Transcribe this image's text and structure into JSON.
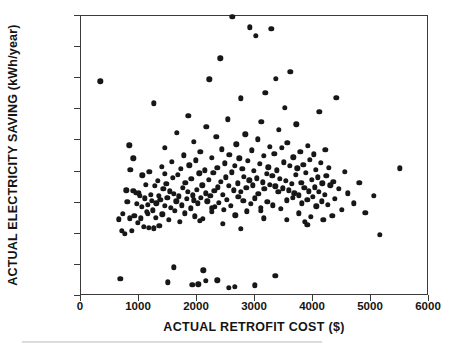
{
  "figure": {
    "kind": "scatter-plot",
    "background_color": "#ffffff",
    "marker_color": "#171717",
    "axis_color": "#3a3a3a"
  },
  "axis_titles": {
    "y": "ACTUAL ELECTRICITY SAVING (kWh/year)",
    "x": "ACTUAL RETROFIT COST ($)"
  },
  "chart_data": {
    "type": "scatter",
    "title": "",
    "xlabel": "ACTUAL RETROFIT COST ($)",
    "ylabel": "ACTUAL ELECTRICITY SAVING (kWh/year)",
    "xlim": [
      0,
      6000
    ],
    "ylim": [
      -5000,
      17500
    ],
    "xticks": [
      0,
      1000,
      2000,
      3000,
      4000,
      5000,
      6000
    ],
    "xtick_labels": [
      "0",
      "1000",
      "2000",
      "3000",
      "4000",
      "5000",
      "6000"
    ],
    "yticks": [
      -5000,
      -2500,
      0,
      2500,
      5000,
      7500,
      10000,
      12500,
      15000,
      17500
    ],
    "ytick_labels": [
      "-5000",
      "-2500",
      "0",
      "2500",
      "5000",
      "7500",
      "10000",
      "12500",
      "15000",
      "17500"
    ],
    "grid": false,
    "legend": false,
    "marker": "filled-circle",
    "marker_color": "#171717",
    "n_points": 248,
    "points": [
      [
        330,
        12250
      ],
      [
        650,
        1150
      ],
      [
        680,
        -3600
      ],
      [
        700,
        250
      ],
      [
        720,
        1600
      ],
      [
        760,
        0
      ],
      [
        780,
        3500
      ],
      [
        800,
        2550
      ],
      [
        830,
        7100
      ],
      [
        840,
        1250
      ],
      [
        850,
        5150
      ],
      [
        880,
        250
      ],
      [
        900,
        3450
      ],
      [
        920,
        1450
      ],
      [
        940,
        3300
      ],
      [
        960,
        2400
      ],
      [
        980,
        900
      ],
      [
        1000,
        3250
      ],
      [
        1010,
        3050
      ],
      [
        1030,
        1250
      ],
      [
        1050,
        2150
      ],
      [
        1060,
        4700
      ],
      [
        1080,
        550
      ],
      [
        1100,
        2850
      ],
      [
        1120,
        3950
      ],
      [
        1130,
        1750
      ],
      [
        1150,
        2350
      ],
      [
        1170,
        500
      ],
      [
        1180,
        5000
      ],
      [
        1200,
        3150
      ],
      [
        1220,
        2650
      ],
      [
        1240,
        1900
      ],
      [
        1250,
        10500
      ],
      [
        1270,
        3850
      ],
      [
        1290,
        1300
      ],
      [
        1300,
        2450
      ],
      [
        1320,
        4250
      ],
      [
        1340,
        3050
      ],
      [
        1350,
        650
      ],
      [
        1370,
        2750
      ],
      [
        1390,
        5400
      ],
      [
        1400,
        1550
      ],
      [
        1420,
        3600
      ],
      [
        1440,
        2250
      ],
      [
        1450,
        6900
      ],
      [
        1470,
        4000
      ],
      [
        1490,
        2900
      ],
      [
        1500,
        -3900
      ],
      [
        1510,
        1100
      ],
      [
        1530,
        3400
      ],
      [
        1550,
        2100
      ],
      [
        1570,
        5800
      ],
      [
        1580,
        4500
      ],
      [
        1600,
        3200
      ],
      [
        1620,
        1850
      ],
      [
        1640,
        2600
      ],
      [
        1650,
        8100
      ],
      [
        1670,
        4750
      ],
      [
        1690,
        3000
      ],
      [
        1700,
        950
      ],
      [
        1720,
        5200
      ],
      [
        1740,
        2300
      ],
      [
        1750,
        3700
      ],
      [
        1770,
        6300
      ],
      [
        1790,
        1650
      ],
      [
        1800,
        4100
      ],
      [
        1820,
        2800
      ],
      [
        1840,
        3350
      ],
      [
        1850,
        9500
      ],
      [
        1870,
        5500
      ],
      [
        1890,
        2050
      ],
      [
        1900,
        4400
      ],
      [
        1920,
        -4100
      ],
      [
        1930,
        3100
      ],
      [
        1950,
        7400
      ],
      [
        1960,
        1400
      ],
      [
        1980,
        5900
      ],
      [
        2000,
        3550
      ],
      [
        2010,
        2450
      ],
      [
        2020,
        -4050
      ],
      [
        2040,
        4850
      ],
      [
        2060,
        6600
      ],
      [
        2070,
        2900
      ],
      [
        2090,
        3900
      ],
      [
        2100,
        1200
      ],
      [
        2110,
        -2950
      ],
      [
        2130,
        5100
      ],
      [
        2150,
        3250
      ],
      [
        2160,
        8600
      ],
      [
        2180,
        2600
      ],
      [
        2200,
        4350
      ],
      [
        2210,
        12400
      ],
      [
        2230,
        3050
      ],
      [
        2250,
        6100
      ],
      [
        2260,
        1750
      ],
      [
        2280,
        4900
      ],
      [
        2300,
        3450
      ],
      [
        2310,
        2150
      ],
      [
        2330,
        7800
      ],
      [
        2350,
        5300
      ],
      [
        2360,
        3750
      ],
      [
        2380,
        2500
      ],
      [
        2400,
        14100
      ],
      [
        2410,
        4200
      ],
      [
        2430,
        6800
      ],
      [
        2450,
        3150
      ],
      [
        2460,
        1950
      ],
      [
        2480,
        5650
      ],
      [
        2500,
        4550
      ],
      [
        2510,
        2750
      ],
      [
        2530,
        9200
      ],
      [
        2550,
        3850
      ],
      [
        2560,
        6350
      ],
      [
        2580,
        2250
      ],
      [
        2600,
        4950
      ],
      [
        2610,
        17450
      ],
      [
        2630,
        3500
      ],
      [
        2650,
        5450
      ],
      [
        2660,
        1500
      ],
      [
        2680,
        7200
      ],
      [
        2700,
        4050
      ],
      [
        2710,
        2950
      ],
      [
        2730,
        6050
      ],
      [
        2750,
        3350
      ],
      [
        2760,
        10900
      ],
      [
        2780,
        5200
      ],
      [
        2800,
        2650
      ],
      [
        2810,
        4600
      ],
      [
        2830,
        8000
      ],
      [
        2850,
        3700
      ],
      [
        2860,
        1800
      ],
      [
        2880,
        5850
      ],
      [
        2900,
        4300
      ],
      [
        2910,
        16600
      ],
      [
        2930,
        2400
      ],
      [
        2950,
        6700
      ],
      [
        2960,
        3900
      ],
      [
        2980,
        5050
      ],
      [
        3000,
        2850
      ],
      [
        3010,
        15900
      ],
      [
        3030,
        4450
      ],
      [
        3050,
        7600
      ],
      [
        3060,
        3200
      ],
      [
        3080,
        5600
      ],
      [
        3100,
        2100
      ],
      [
        3110,
        9000
      ],
      [
        3130,
        4150
      ],
      [
        3150,
        6250
      ],
      [
        3160,
        3600
      ],
      [
        3180,
        11350
      ],
      [
        3200,
        4800
      ],
      [
        3210,
        2550
      ],
      [
        3230,
        5350
      ],
      [
        3250,
        7000
      ],
      [
        3260,
        3950
      ],
      [
        3280,
        16450
      ],
      [
        3300,
        4650
      ],
      [
        3310,
        2300
      ],
      [
        3330,
        6450
      ],
      [
        3350,
        3800
      ],
      [
        3360,
        12450
      ],
      [
        3380,
        5100
      ],
      [
        3400,
        3350
      ],
      [
        3410,
        8350
      ],
      [
        3430,
        4400
      ],
      [
        3450,
        2000
      ],
      [
        3460,
        6900
      ],
      [
        3480,
        3650
      ],
      [
        3500,
        5750
      ],
      [
        3510,
        10100
      ],
      [
        3530,
        4250
      ],
      [
        3550,
        2700
      ],
      [
        3560,
        7300
      ],
      [
        3580,
        3500
      ],
      [
        3600,
        5450
      ],
      [
        3610,
        13000
      ],
      [
        3630,
        4000
      ],
      [
        3650,
        2900
      ],
      [
        3660,
        6150
      ],
      [
        3680,
        3250
      ],
      [
        3700,
        4750
      ],
      [
        3710,
        8800
      ],
      [
        3730,
        5250
      ],
      [
        3750,
        3100
      ],
      [
        3760,
        1650
      ],
      [
        3780,
        6600
      ],
      [
        3800,
        4100
      ],
      [
        3810,
        2450
      ],
      [
        3830,
        5550
      ],
      [
        3850,
        3700
      ],
      [
        3860,
        950
      ],
      [
        3880,
        4900
      ],
      [
        3900,
        2750
      ],
      [
        3910,
        7050
      ],
      [
        3930,
        3400
      ],
      [
        3950,
        5950
      ],
      [
        3960,
        1350
      ],
      [
        3980,
        4350
      ],
      [
        4000,
        2950
      ],
      [
        4010,
        6400
      ],
      [
        4030,
        3750
      ],
      [
        4050,
        5150
      ],
      [
        4060,
        2200
      ],
      [
        4080,
        4550
      ],
      [
        4100,
        3350
      ],
      [
        4110,
        9800
      ],
      [
        4130,
        5700
      ],
      [
        4150,
        2600
      ],
      [
        4160,
        4050
      ],
      [
        4180,
        1100
      ],
      [
        4200,
        3150
      ],
      [
        4210,
        6750
      ],
      [
        4230,
        4650
      ],
      [
        4250,
        2350
      ],
      [
        4270,
        5300
      ],
      [
        4300,
        3900
      ],
      [
        4330,
        1450
      ],
      [
        4350,
        4200
      ],
      [
        4380,
        2800
      ],
      [
        4400,
        10950
      ],
      [
        4450,
        3600
      ],
      [
        4500,
        1950
      ],
      [
        4550,
        5000
      ],
      [
        4600,
        3250
      ],
      [
        4700,
        2450
      ],
      [
        4800,
        4100
      ],
      [
        4900,
        1700
      ],
      [
        5050,
        3050
      ],
      [
        5150,
        -100
      ],
      [
        5500,
        5250
      ],
      [
        900,
        6050
      ],
      [
        1250,
        450
      ],
      [
        1600,
        -2700
      ],
      [
        2050,
        1050
      ],
      [
        2450,
        800
      ],
      [
        2750,
        400
      ],
      [
        3150,
        1250
      ],
      [
        3350,
        -3400
      ],
      [
        2150,
        -3800
      ],
      [
        2350,
        -3750
      ],
      [
        2550,
        -4350
      ],
      [
        2650,
        -4250
      ],
      [
        3000,
        -4150
      ],
      [
        1150,
        1600
      ],
      [
        1450,
        4800
      ],
      [
        1950,
        2700
      ],
      [
        2250,
        2050
      ],
      [
        3100,
        1850
      ],
      [
        3550,
        1100
      ],
      [
        3900,
        700
      ]
    ]
  }
}
